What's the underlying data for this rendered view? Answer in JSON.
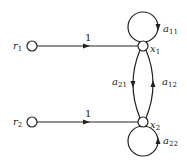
{
  "diagram": {
    "type": "signal-flow-graph",
    "nodes": [
      {
        "id": "r1",
        "label": "r",
        "subscript": "1"
      },
      {
        "id": "x1",
        "label": "x",
        "subscript": "1"
      },
      {
        "id": "r2",
        "label": "r",
        "subscript": "2"
      },
      {
        "id": "x2",
        "label": "x",
        "subscript": "2"
      }
    ],
    "edges": [
      {
        "from": "r1",
        "to": "x1",
        "gain": "1"
      },
      {
        "from": "r2",
        "to": "x2",
        "gain": "1"
      },
      {
        "from": "x1",
        "to": "x1",
        "gain_label": "a",
        "gain_subscript": "11"
      },
      {
        "from": "x2",
        "to": "x2",
        "gain_label": "a",
        "gain_subscript": "22"
      },
      {
        "from": "x1",
        "to": "x2",
        "gain_label": "a",
        "gain_subscript": "21"
      },
      {
        "from": "x2",
        "to": "x1",
        "gain_label": "a",
        "gain_subscript": "12"
      }
    ]
  },
  "labels": {
    "r1": "r",
    "r1_sub": "1",
    "x1": "x",
    "x1_sub": "1",
    "r2": "r",
    "r2_sub": "2",
    "x2": "x",
    "x2_sub": "2",
    "e_r1x1": "1",
    "e_r2x2": "1",
    "a11": "a",
    "a11_sub": "11",
    "a22": "a",
    "a22_sub": "22",
    "a21": "a",
    "a21_sub": "21",
    "a12": "a",
    "a12_sub": "12"
  }
}
